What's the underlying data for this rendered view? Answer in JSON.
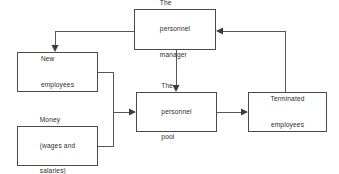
{
  "diagram": {
    "background_color": "#ffffff",
    "line_color": "#585858",
    "box_border_color": "#4a4a4a",
    "text_color": "#2e2e2e",
    "nodes": [
      {
        "id": "personnel-manager",
        "label_lines": [
          "The",
          "personnel",
          "manager"
        ],
        "line1": "The",
        "line2": "personnel",
        "line3": "manager",
        "x": 134,
        "y": 9,
        "width": 82,
        "height": 41
      },
      {
        "id": "new-employees",
        "label_lines": [
          "New",
          "employees"
        ],
        "line1": "New",
        "line2": "employees",
        "x": 17,
        "y": 52,
        "width": 81,
        "height": 40
      },
      {
        "id": "money",
        "label_lines": [
          "Money",
          "(wages and",
          "salaries)"
        ],
        "line1": "Money",
        "line2": "(wages and",
        "line3": "salaries)",
        "x": 17,
        "y": 126,
        "width": 81,
        "height": 40
      },
      {
        "id": "personnel-pool",
        "label_lines": [
          "The",
          "personnel",
          "pool"
        ],
        "line1": "The",
        "line2": "personnel",
        "line3": "pool",
        "x": 136,
        "y": 92,
        "width": 81,
        "height": 40
      },
      {
        "id": "terminated-employees",
        "label_lines": [
          "Terminated",
          "employees"
        ],
        "line1": "Terminated",
        "line2": "employees",
        "x": 248,
        "y": 92,
        "width": 79,
        "height": 40
      }
    ],
    "edges": [
      {
        "id": "manager-to-new-employees",
        "from": "personnel-manager",
        "to": "new-employees",
        "path": "M 134 31 L 55 31 L 55 48",
        "arrow": "down",
        "arrow_x": 55,
        "arrow_y": 52
      },
      {
        "id": "manager-to-pool",
        "from": "personnel-manager",
        "to": "personnel-pool",
        "path": "M 176 50 L 176 88",
        "arrow": "down",
        "arrow_x": 176,
        "arrow_y": 92
      },
      {
        "id": "terminated-to-manager",
        "from": "terminated-employees",
        "to": "personnel-manager",
        "path": "M 285 92 L 285 31 L 220 31",
        "arrow": "left",
        "arrow_x": 216,
        "arrow_y": 31
      },
      {
        "id": "new-employees-to-pool",
        "from": "new-employees",
        "to": "personnel-pool",
        "path": "M 98 72 L 113 72 L 113 112 L 132 112",
        "arrow": "right",
        "arrow_x": 136,
        "arrow_y": 112
      },
      {
        "id": "money-to-pool",
        "from": "money",
        "to": "personnel-pool",
        "path": "M 98 146 L 113 146 L 113 112",
        "arrow": "none"
      },
      {
        "id": "pool-to-terminated",
        "from": "personnel-pool",
        "to": "terminated-employees",
        "path": "M 217 112 L 244 112",
        "arrow": "right",
        "arrow_x": 248,
        "arrow_y": 112
      }
    ]
  }
}
